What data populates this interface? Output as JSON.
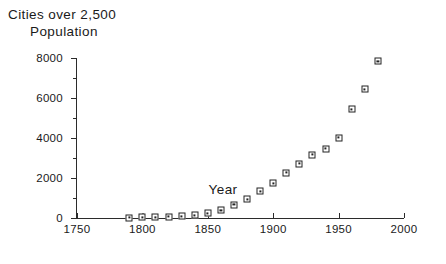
{
  "title": {
    "line1": "Cities over 2,500",
    "line2": "Population"
  },
  "axes": {
    "x_title": "Year",
    "y_title": "",
    "x_ticks": [
      "1750",
      "1800",
      "1850",
      "1900",
      "1950",
      "2000"
    ],
    "y_ticks": [
      "0",
      "2000",
      "4000",
      "6000",
      "8000"
    ]
  },
  "chart_data": {
    "type": "scatter",
    "title": "Cities over 2,500 Population",
    "xlabel": "Year",
    "ylabel": "",
    "xlim": [
      1750,
      2000
    ],
    "ylim": [
      0,
      8000
    ],
    "grid": false,
    "legend": "none",
    "x_major_tick_step": 50,
    "y_major_tick_step": 2000,
    "y_minor_tick_step": 1000,
    "marker": "open-square-with-center-dot",
    "x": [
      1790,
      1800,
      1810,
      1820,
      1830,
      1840,
      1850,
      1860,
      1870,
      1880,
      1890,
      1900,
      1910,
      1920,
      1930,
      1940,
      1950,
      1960,
      1970,
      1980
    ],
    "y": [
      24,
      33,
      46,
      61,
      90,
      131,
      236,
      392,
      663,
      939,
      1348,
      1737,
      2262,
      2722,
      3165,
      3464,
      4023,
      5445,
      6435,
      7840
    ],
    "series": [
      {
        "name": "Cities over 2,500 population",
        "points": [
          {
            "year": 1790,
            "value": 24
          },
          {
            "year": 1800,
            "value": 33
          },
          {
            "year": 1810,
            "value": 46
          },
          {
            "year": 1820,
            "value": 61
          },
          {
            "year": 1830,
            "value": 90
          },
          {
            "year": 1840,
            "value": 131
          },
          {
            "year": 1850,
            "value": 236
          },
          {
            "year": 1860,
            "value": 392
          },
          {
            "year": 1870,
            "value": 663
          },
          {
            "year": 1880,
            "value": 939
          },
          {
            "year": 1890,
            "value": 1348
          },
          {
            "year": 1900,
            "value": 1737
          },
          {
            "year": 1910,
            "value": 2262
          },
          {
            "year": 1920,
            "value": 2722
          },
          {
            "year": 1930,
            "value": 3165
          },
          {
            "year": 1940,
            "value": 3464
          },
          {
            "year": 1950,
            "value": 4023
          },
          {
            "year": 1960,
            "value": 5445
          },
          {
            "year": 1970,
            "value": 6435
          },
          {
            "year": 1980,
            "value": 7840
          }
        ]
      }
    ]
  }
}
